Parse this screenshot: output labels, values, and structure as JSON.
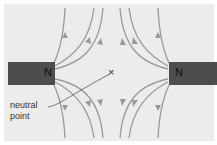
{
  "diagram": {
    "magnets": [
      {
        "pole": "N",
        "side": "left"
      },
      {
        "pole": "N",
        "side": "right"
      }
    ],
    "neutral_point_marker": "×",
    "label_line1": "neutral",
    "label_line2": "point",
    "colors": {
      "background": "#ececec",
      "magnet": "#4d4d4d",
      "field_line": "#999999",
      "text": "#333333"
    }
  }
}
